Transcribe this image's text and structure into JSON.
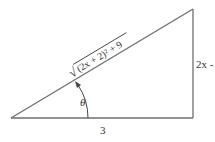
{
  "diagram": {
    "type": "right-triangle",
    "colors": {
      "stroke": "#6e6e6e",
      "text": "#333333",
      "background": "#ffffff"
    },
    "vertices": {
      "bottom_left": [
        11,
        118
      ],
      "bottom_right": [
        193,
        118
      ],
      "top_right": [
        193,
        9
      ]
    },
    "labels": {
      "hypotenuse": "(2x + 2)² + 9",
      "hypotenuse_radical": "√",
      "vertical_side": "2x -",
      "base": "3",
      "angle": "θ"
    }
  }
}
